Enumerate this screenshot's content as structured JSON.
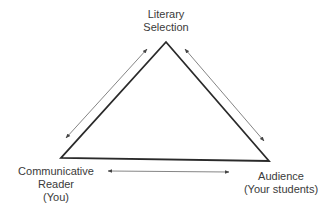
{
  "diagram": {
    "type": "triangle",
    "nodes": {
      "top": {
        "lines": [
          "Literary",
          "Selection"
        ]
      },
      "left": {
        "lines": [
          "Communicative",
          "Reader",
          "(You)"
        ]
      },
      "right": {
        "lines": [
          "Audience",
          "(Your students)"
        ]
      }
    },
    "edges": [
      {
        "from": "left",
        "to": "top",
        "style": "double-arrow"
      },
      {
        "from": "top",
        "to": "right",
        "style": "double-arrow"
      },
      {
        "from": "left",
        "to": "right",
        "style": "double-arrow"
      }
    ],
    "colors": {
      "line": "#2a2a2a",
      "arrow": "#555555",
      "text": "#3a3a3a"
    }
  }
}
